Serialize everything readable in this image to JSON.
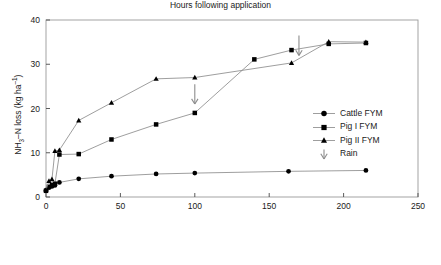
{
  "chart_data": {
    "type": "line",
    "title": "",
    "xlabel": "Hours following application",
    "ylabel": "NH3-N loss (kg ha-1)",
    "ylabel_parts": {
      "pre": "NH",
      "sub": "3",
      "mid": "–N loss (kg ha",
      "sup": "–1",
      "post": ")"
    },
    "xlim": [
      0,
      250
    ],
    "ylim": [
      0,
      40
    ],
    "xticks": [
      0,
      50,
      100,
      150,
      200,
      250
    ],
    "yticks": [
      0,
      10,
      20,
      30,
      40
    ],
    "grid": false,
    "legend_position": "right-middle",
    "series": [
      {
        "name": "Cattle FYM",
        "marker": "circle",
        "x": [
          0,
          2,
          4,
          6,
          9,
          22,
          44,
          74,
          100,
          163,
          215
        ],
        "y": [
          1.5,
          2.1,
          2.4,
          2.6,
          3.3,
          4.1,
          4.7,
          5.2,
          5.4,
          5.8,
          6.0
        ]
      },
      {
        "name": "Pig I FYM",
        "marker": "square",
        "x": [
          0,
          2,
          4,
          6,
          9,
          22,
          44,
          74,
          100,
          140,
          165,
          190,
          215
        ],
        "y": [
          1.4,
          2.3,
          2.7,
          3.0,
          9.6,
          9.7,
          13.0,
          16.4,
          19.0,
          31.1,
          33.2,
          34.6,
          34.8
        ]
      },
      {
        "name": "Pig II FYM",
        "marker": "triangle",
        "x": [
          0,
          2,
          4,
          6,
          9,
          22,
          44,
          74,
          100,
          165,
          190,
          215
        ],
        "y": [
          1.6,
          3.6,
          4.0,
          10.4,
          10.6,
          17.3,
          21.3,
          26.7,
          27.0,
          30.3,
          35.1,
          35.0
        ]
      }
    ],
    "annotations": [
      {
        "label": "Rain",
        "marker": "down-arrow",
        "x": 100,
        "y_top": 25.5,
        "y_bottom": 21.0
      },
      {
        "label": "Rain",
        "marker": "down-arrow",
        "x": 170,
        "y_top": 36.5,
        "y_bottom": 32.0
      }
    ]
  },
  "legend": {
    "items": [
      {
        "label": "Cattle FYM",
        "marker": "circle"
      },
      {
        "label": "Pig I FYM",
        "marker": "square"
      },
      {
        "label": "Pig II FYM",
        "marker": "triangle"
      },
      {
        "label": "Rain",
        "marker": "down-arrow"
      }
    ]
  }
}
